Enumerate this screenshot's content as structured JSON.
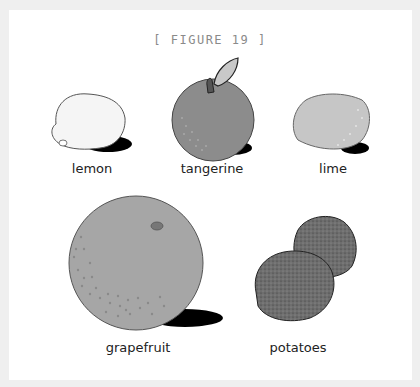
{
  "figure": {
    "title": "[ FIGURE 19 ]"
  },
  "items": [
    {
      "id": "lemon",
      "label": "lemon",
      "fill": "#f4f4f4"
    },
    {
      "id": "tangerine",
      "label": "tangerine",
      "fill": "#8a8a8a"
    },
    {
      "id": "lime",
      "label": "lime",
      "fill": "#c4c4c4"
    },
    {
      "id": "grapefruit",
      "label": "grapefruit",
      "fill": "#a4a4a4"
    },
    {
      "id": "potatoes",
      "label": "potatoes",
      "fill": "#7a7a7a"
    }
  ],
  "colors": {
    "frame": "#efefef",
    "panel": "#ffffff",
    "outline": "#333333",
    "shadow": "#000000"
  }
}
